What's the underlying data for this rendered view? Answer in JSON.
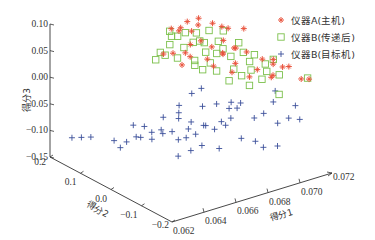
{
  "chart_data": {
    "type": "scatter",
    "projection": "3d",
    "title": "",
    "xlabel": "得分1",
    "ylabel": "得分2",
    "zlabel": "得分3",
    "xlim": [
      0.062,
      0.072
    ],
    "ylim": [
      -0.2,
      0.2
    ],
    "zlim": [
      -0.15,
      0.1
    ],
    "xticks": [
      "0.062",
      "0.064",
      "0.066",
      "0.068",
      "0.070",
      "0.072"
    ],
    "yticks": [
      "-0.2",
      "-0.1",
      "0.0",
      "0.1",
      "0.2"
    ],
    "zticks": [
      "0.10",
      "0.05",
      "0.00",
      "-0.05",
      "-0.10",
      "-0.15"
    ],
    "legend_position": "top-right",
    "series": [
      {
        "name": "仪器A(主机)",
        "marker": "asterisk",
        "color": "#e8503a",
        "points": [
          [
            0.0672,
            0.05,
            0.085
          ],
          [
            0.0675,
            0.06,
            0.085
          ],
          [
            0.0681,
            0.07,
            0.088
          ],
          [
            0.0684,
            0.05,
            0.085
          ],
          [
            0.069,
            0.08,
            0.083
          ],
          [
            0.0693,
            0.05,
            0.08
          ],
          [
            0.0695,
            0.03,
            0.078
          ],
          [
            0.0697,
            0.02,
            0.076
          ],
          [
            0.0703,
            0.0,
            0.076
          ],
          [
            0.0678,
            0.04,
            0.082
          ],
          [
            0.0671,
            0.07,
            0.084
          ],
          [
            0.068,
            0.02,
            0.068
          ],
          [
            0.0683,
            0.0,
            0.06
          ],
          [
            0.0686,
            -0.02,
            0.052
          ],
          [
            0.0694,
            0.02,
            0.056
          ],
          [
            0.0698,
            0.0,
            0.044
          ],
          [
            0.0701,
            -0.02,
            0.04
          ],
          [
            0.0705,
            -0.05,
            0.032
          ],
          [
            0.0708,
            -0.07,
            0.026
          ],
          [
            0.071,
            -0.06,
            0.03
          ],
          [
            0.0712,
            -0.08,
            0.02
          ],
          [
            0.0714,
            -0.09,
            0.022
          ],
          [
            0.069,
            0.0,
            0.04
          ],
          [
            0.0692,
            -0.03,
            0.03
          ],
          [
            0.0688,
            -0.04,
            0.02
          ],
          [
            0.07,
            -0.06,
            0.02
          ],
          [
            0.0703,
            -0.09,
            0.012
          ],
          [
            0.0706,
            -0.08,
            0.01
          ],
          [
            0.0684,
            0.02,
            0.03
          ],
          [
            0.0679,
            0.05,
            0.03
          ],
          [
            0.0674,
            0.08,
            0.032
          ],
          [
            0.0668,
            0.08,
            0.036
          ],
          [
            0.0672,
            0.04,
            0.024
          ],
          [
            0.0686,
            0.01,
            0.018
          ],
          [
            0.0697,
            -0.05,
            0.006
          ],
          [
            0.0716,
            -0.12,
            0.006
          ],
          [
            0.0719,
            -0.13,
            0.006
          ],
          [
            0.0681,
            0.06,
            0.048
          ],
          [
            0.0676,
            0.05,
            0.04
          ],
          [
            0.0695,
            -0.01,
            0.05
          ]
        ]
      },
      {
        "name": "仪器B(传递后)",
        "marker": "square",
        "color": "#7cc04c",
        "points": [
          [
            0.067,
            0.07,
            0.08
          ],
          [
            0.0676,
            0.05,
            0.078
          ],
          [
            0.0681,
            0.04,
            0.076
          ],
          [
            0.0687,
            0.03,
            0.078
          ],
          [
            0.0694,
            0.02,
            0.074
          ],
          [
            0.0675,
            0.07,
            0.066
          ],
          [
            0.0679,
            0.04,
            0.06
          ],
          [
            0.0684,
            0.03,
            0.058
          ],
          [
            0.069,
            0.0,
            0.05
          ],
          [
            0.0697,
            -0.03,
            0.046
          ],
          [
            0.0702,
            -0.04,
            0.04
          ],
          [
            0.0672,
            0.08,
            0.05
          ],
          [
            0.0677,
            0.06,
            0.046
          ],
          [
            0.0683,
            0.02,
            0.044
          ],
          [
            0.0688,
            0.01,
            0.04
          ],
          [
            0.0693,
            -0.01,
            0.036
          ],
          [
            0.0699,
            -0.04,
            0.03
          ],
          [
            0.0705,
            -0.06,
            0.026
          ],
          [
            0.071,
            -0.06,
            0.03
          ],
          [
            0.0668,
            0.09,
            0.036
          ],
          [
            0.0673,
            0.06,
            0.03
          ],
          [
            0.0678,
            0.03,
            0.03
          ],
          [
            0.0684,
            0.01,
            0.026
          ],
          [
            0.0691,
            -0.03,
            0.02
          ],
          [
            0.0698,
            -0.05,
            0.018
          ],
          [
            0.0704,
            -0.07,
            0.016
          ],
          [
            0.0667,
            0.1,
            0.02
          ],
          [
            0.0671,
            0.09,
            0.028
          ],
          [
            0.068,
            0.04,
            0.016
          ],
          [
            0.0686,
            0.0,
            0.012
          ],
          [
            0.0694,
            -0.04,
            0.008
          ],
          [
            0.0701,
            -0.07,
            0.004
          ],
          [
            0.0708,
            -0.09,
            0.012
          ],
          [
            0.0683,
            0.03,
            0.008
          ],
          [
            0.069,
            -0.02,
            -0.004
          ],
          [
            0.0697,
            -0.05,
            -0.01
          ],
          [
            0.072,
            -0.12,
            0.004
          ],
          [
            0.0706,
            -0.1,
            -0.02
          ],
          [
            0.0689,
            0.01,
            0.062
          ],
          [
            0.0675,
            0.09,
            0.06
          ],
          [
            0.0696,
            -0.02,
            0.062
          ],
          [
            0.0685,
            0.05,
            0.054
          ]
        ]
      },
      {
        "name": "仪器B(目标机)",
        "marker": "plus",
        "color": "#3b4f9a",
        "points": [
          [
            0.0628,
            0.17,
            -0.112
          ],
          [
            0.0632,
            0.16,
            -0.112
          ],
          [
            0.0636,
            0.15,
            -0.112
          ],
          [
            0.0641,
            0.1,
            -0.108
          ],
          [
            0.0645,
            0.08,
            -0.108
          ],
          [
            0.0643,
            0.09,
            -0.12
          ],
          [
            0.065,
            0.06,
            -0.098
          ],
          [
            0.0651,
            0.08,
            -0.104
          ],
          [
            0.0655,
            0.05,
            -0.09
          ],
          [
            0.0659,
            0.04,
            -0.086
          ],
          [
            0.066,
            0.04,
            -0.094
          ],
          [
            0.0662,
            0.02,
            -0.086
          ],
          [
            0.0657,
            0.06,
            -0.108
          ],
          [
            0.0664,
            0.01,
            -0.1
          ],
          [
            0.0667,
            0.0,
            -0.096
          ],
          [
            0.0671,
            -0.01,
            -0.09
          ],
          [
            0.0668,
            0.03,
            -0.07
          ],
          [
            0.067,
            0.04,
            -0.064
          ],
          [
            0.0672,
            0.01,
            -0.074
          ],
          [
            0.0676,
            -0.01,
            -0.078
          ],
          [
            0.0679,
            -0.03,
            -0.082
          ],
          [
            0.0684,
            -0.04,
            -0.076
          ],
          [
            0.0681,
            0.02,
            -0.056
          ],
          [
            0.0686,
            0.0,
            -0.05
          ],
          [
            0.069,
            -0.02,
            -0.056
          ],
          [
            0.0686,
            0.05,
            -0.036
          ],
          [
            0.068,
            0.05,
            -0.04
          ],
          [
            0.0695,
            -0.02,
            -0.06
          ],
          [
            0.07,
            -0.05,
            -0.074
          ],
          [
            0.0704,
            -0.06,
            -0.066
          ],
          [
            0.0707,
            -0.09,
            -0.078
          ],
          [
            0.0712,
            -0.1,
            -0.07
          ],
          [
            0.0717,
            -0.11,
            -0.074
          ],
          [
            0.069,
            -0.06,
            -0.1
          ],
          [
            0.0695,
            -0.08,
            -0.104
          ],
          [
            0.07,
            -0.08,
            -0.12
          ],
          [
            0.0705,
            -0.1,
            -0.116
          ],
          [
            0.0673,
            -0.02,
            -0.11
          ],
          [
            0.068,
            -0.04,
            -0.116
          ],
          [
            0.0668,
            -0.01,
            -0.118
          ],
          [
            0.0662,
            0.0,
            -0.126
          ],
          [
            0.0676,
            0.04,
            -0.1
          ],
          [
            0.0683,
            0.02,
            -0.094
          ],
          [
            0.0689,
            0.0,
            -0.086
          ],
          [
            0.0693,
            -0.01,
            -0.08
          ],
          [
            0.071,
            -0.06,
            -0.05
          ],
          [
            0.0658,
            0.09,
            -0.094
          ],
          [
            0.0653,
            0.1,
            -0.09
          ],
          [
            0.0666,
            0.07,
            -0.078
          ],
          [
            0.0697,
            0.01,
            -0.06
          ],
          [
            0.0701,
            0.0,
            -0.062
          ],
          [
            0.0715,
            -0.04,
            -0.04
          ],
          [
            0.072,
            -0.08,
            -0.06
          ],
          [
            0.0674,
            0.06,
            -0.06
          ]
        ]
      }
    ]
  }
}
